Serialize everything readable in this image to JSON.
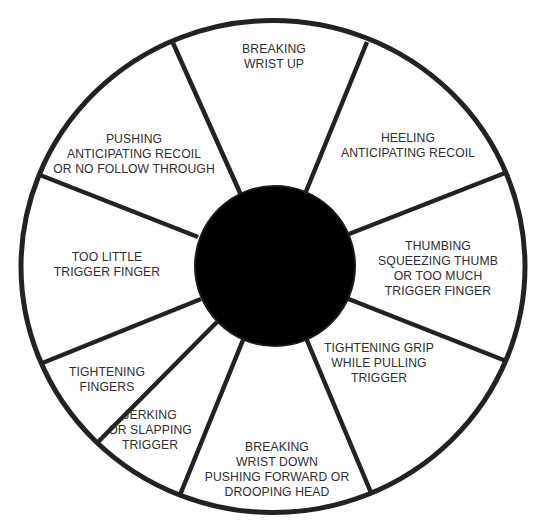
{
  "diagram": {
    "type": "pistol-shooting-error-correction-wheel",
    "colors": {
      "background": "#ffffff",
      "lines": "#222222",
      "center": "#000000",
      "text": "#2e2e2e"
    },
    "segments": [
      {
        "id": "breaking-wrist-up",
        "lines": [
          "BREAKING",
          "WRIST UP"
        ]
      },
      {
        "id": "heeling",
        "lines": [
          "HEELING",
          "ANTICIPATING RECOIL"
        ]
      },
      {
        "id": "thumbing",
        "lines": [
          "THUMBING",
          "SQUEEZING THUMB",
          "OR TOO MUCH",
          "TRIGGER FINGER"
        ]
      },
      {
        "id": "tightening-grip",
        "lines": [
          "TIGHTENING GRIP",
          "WHILE PULLING",
          "TRIGGER"
        ]
      },
      {
        "id": "breaking-wrist-down",
        "lines": [
          "BREAKING",
          "WRIST DOWN",
          "PUSHING FORWARD OR",
          "DROOPING HEAD"
        ]
      },
      {
        "id": "jerking",
        "lines": [
          "JERKING",
          "OR SLAPPING",
          "TRIGGER"
        ]
      },
      {
        "id": "tightening-fingers",
        "lines": [
          "TIGHTENING",
          "FINGERS"
        ]
      },
      {
        "id": "too-little-trigger-finger",
        "lines": [
          "TOO LITTLE",
          "TRIGGER FINGER"
        ]
      },
      {
        "id": "pushing",
        "lines": [
          "PUSHING",
          "ANTICIPATING RECOIL",
          "OR NO FOLLOW THROUGH"
        ]
      }
    ]
  }
}
